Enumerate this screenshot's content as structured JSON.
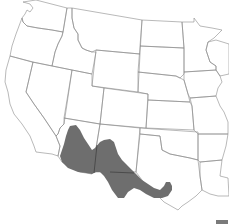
{
  "map": {
    "title": "",
    "region": "Western United States",
    "range_label": "Species range",
    "colors": {
      "background": "#ffffff",
      "state_border": "#8a8a8a",
      "range_fill": "#6e6e6e",
      "legend_swatch": "#7a7a7a"
    },
    "states_shown": [
      "WA",
      "OR",
      "CA",
      "ID",
      "NV",
      "MT",
      "WY",
      "UT",
      "AZ",
      "CO",
      "NM",
      "ND",
      "SD",
      "NE",
      "KS",
      "OK",
      "TX",
      "MN",
      "IA",
      "MO",
      "AR",
      "LA",
      "WI",
      "IL"
    ],
    "range_states": [
      "AZ",
      "NM",
      "TX"
    ]
  },
  "legend": {
    "swatch_label": ""
  }
}
